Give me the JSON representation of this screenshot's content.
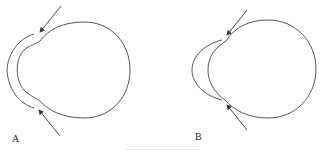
{
  "figure": {
    "panels": [
      {
        "id": "A",
        "label": "A",
        "description": "Globe outline with a separate outer corneal arc; arrows point to the gap at the limbus above and below"
      },
      {
        "id": "B",
        "label": "B",
        "description": "Globe outline with outer corneal arc meeting the globe at the limbus; arrows point to junctions above and below"
      }
    ],
    "caption": "",
    "colors": {
      "line": "#444444",
      "label": "#222222",
      "caption": "#d8d8d8"
    }
  }
}
